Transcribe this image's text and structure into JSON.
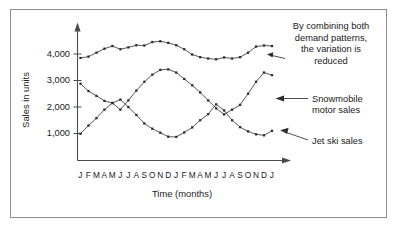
{
  "chart_data": {
    "type": "line",
    "title": "",
    "xlabel": "Time (months)",
    "ylabel": "Sales in units",
    "grid": false,
    "legend_position": "annotations",
    "ylim": [
      0,
      5000
    ],
    "yticks": [
      1000,
      2000,
      3000,
      4000
    ],
    "ytick_labels": [
      "1,000",
      "2,000",
      "3,000",
      "4,000"
    ],
    "categories": [
      "J",
      "F",
      "M",
      "A",
      "M",
      "J",
      "J",
      "A",
      "S",
      "O",
      "N",
      "D",
      "J",
      "F",
      "M",
      "A",
      "M",
      "J",
      "J",
      "A",
      "S",
      "O",
      "N",
      "D",
      "J"
    ],
    "series": [
      {
        "name": "Combined demand",
        "values": [
          3850,
          3900,
          4050,
          4200,
          4300,
          4180,
          4250,
          4330,
          4320,
          4450,
          4480,
          4420,
          4330,
          4180,
          3980,
          3880,
          3830,
          3800,
          3870,
          3830,
          3880,
          4050,
          4280,
          4320,
          4300
        ]
      },
      {
        "name": "Snowmobile motor sales",
        "values": [
          2880,
          2600,
          2420,
          2230,
          2150,
          1900,
          2250,
          2620,
          2950,
          3220,
          3400,
          3420,
          3300,
          3060,
          2820,
          2550,
          2250,
          1950,
          1720,
          1900,
          2080,
          2500,
          2950,
          3300,
          3200
        ]
      },
      {
        "name": "Jet ski sales",
        "values": [
          990,
          1300,
          1580,
          1900,
          2150,
          2280,
          2000,
          1700,
          1380,
          1180,
          1030,
          880,
          870,
          1040,
          1230,
          1500,
          1730,
          2100,
          1870,
          1500,
          1240,
          1080,
          970,
          930,
          1100
        ]
      }
    ],
    "annotations": [
      {
        "id": "combined-annotation",
        "lines": [
          "By combining both",
          "demand patterns,",
          "the variation is",
          "reduced"
        ]
      },
      {
        "id": "snowmobile-annotation",
        "lines": [
          "Snowmobile",
          "motor sales"
        ]
      },
      {
        "id": "jetski-annotation",
        "lines": [
          "Jet ski sales"
        ]
      }
    ]
  },
  "axes": {
    "y_title": "Sales in units",
    "x_title": "Time (months)"
  }
}
